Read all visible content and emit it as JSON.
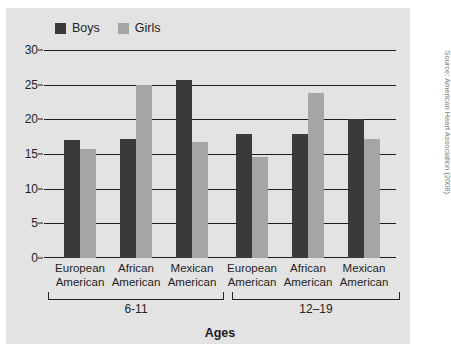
{
  "legend": {
    "entries": [
      {
        "label": "Boys",
        "color": "#3a3a3a"
      },
      {
        "label": "Girls",
        "color": "#a5a5a5"
      }
    ]
  },
  "axis": {
    "y_ticks": [
      "0",
      "5",
      "10",
      "15",
      "20",
      "25",
      "30"
    ],
    "x_title": "Ages"
  },
  "groups": [
    {
      "label": "6-11"
    },
    {
      "label": "12–19"
    }
  ],
  "categories": [
    {
      "line1": "European",
      "line2": "American"
    },
    {
      "line1": "African",
      "line2": "American"
    },
    {
      "line1": "Mexican",
      "line2": "American"
    },
    {
      "line1": "European",
      "line2": "American"
    },
    {
      "line1": "African",
      "line2": "American"
    },
    {
      "line1": "Mexican",
      "line2": "American"
    }
  ],
  "source": "Source: American Heart Association (2008).",
  "colors": {
    "boys": "#3a3a3a",
    "girls": "#a5a5a5",
    "panel": "#e3e3e3",
    "axis": "#1d1d1d",
    "text": "#232323"
  },
  "chart_data": {
    "type": "bar",
    "title": "",
    "xlabel": "Ages",
    "ylabel": "",
    "ylim": [
      0,
      30
    ],
    "yticks": [
      0,
      5,
      10,
      15,
      20,
      25,
      30
    ],
    "grid": true,
    "legend_position": "top-left",
    "categories": [
      "European American",
      "African American",
      "Mexican American",
      "European American",
      "African American",
      "Mexican American"
    ],
    "group_labels": [
      "6-11",
      "12–19"
    ],
    "group_spans": [
      [
        0,
        2
      ],
      [
        3,
        5
      ]
    ],
    "series": [
      {
        "name": "Boys",
        "color": "#3a3a3a",
        "values": [
          17.0,
          17.2,
          25.7,
          17.9,
          17.9,
          20.0
        ]
      },
      {
        "name": "Girls",
        "color": "#a5a5a5",
        "values": [
          15.7,
          25.0,
          16.7,
          14.5,
          23.8,
          17.1
        ]
      }
    ],
    "annotation": "Source: American Heart Association (2008)."
  }
}
